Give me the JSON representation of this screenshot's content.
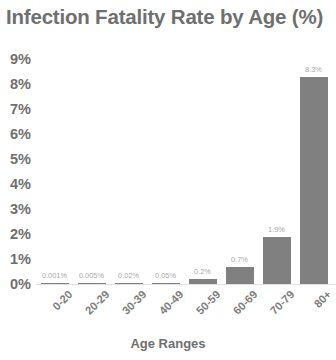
{
  "chart_data": {
    "type": "bar",
    "title": "Infection Fatality Rate by Age (%)",
    "xlabel": "Age Ranges",
    "ylabel": "",
    "categories": [
      "0-20",
      "20-29",
      "30-39",
      "40-49",
      "50-59",
      "60-69",
      "70-79",
      "80+"
    ],
    "values": [
      0.001,
      0.005,
      0.02,
      0.05,
      0.2,
      0.7,
      1.9,
      8.3
    ],
    "value_labels": [
      "0.001%",
      "0.005%",
      "0.02%",
      "0.05%",
      "0.2%",
      "0.7%",
      "1.9%",
      "8.3%"
    ],
    "ylim": [
      0,
      9
    ],
    "ytick_values": [
      0,
      1,
      2,
      3,
      4,
      5,
      6,
      7,
      8,
      9
    ],
    "ytick_labels": [
      "0%",
      "1%",
      "2%",
      "3%",
      "4%",
      "5%",
      "6%",
      "7%",
      "8%",
      "9%"
    ],
    "grid": false,
    "legend": "none",
    "bar_color": "#808080",
    "title_color": "#6f6f6f",
    "tick_color": "#6f6f6f",
    "value_label_color": "#a8a8a8",
    "baseline_color": "#e2e2e2"
  }
}
